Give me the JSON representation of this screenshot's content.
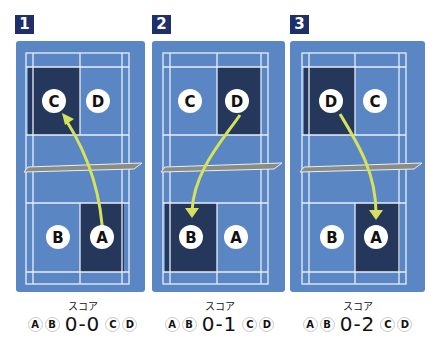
{
  "colors": {
    "panel_bg": "#5b86c4",
    "highlight": "#25385c",
    "lines": "#e8eef8",
    "net": "#8a8d80",
    "arrow": "#d6e25a",
    "badge": "#1e2f6b"
  },
  "score_label": "スコア",
  "panels": [
    {
      "number": "1",
      "top_players": [
        "C",
        "D"
      ],
      "bottom_players": [
        "B",
        "A"
      ],
      "highlight_top": "left",
      "highlight_bottom": "right",
      "shot": "A → C",
      "score": {
        "left_players": [
          "A",
          "B"
        ],
        "value": "0-0",
        "right_players": [
          "C",
          "D"
        ]
      }
    },
    {
      "number": "2",
      "top_players": [
        "C",
        "D"
      ],
      "bottom_players": [
        "B",
        "A"
      ],
      "highlight_top": "right",
      "highlight_bottom": "left",
      "shot": "D → B",
      "score": {
        "left_players": [
          "A",
          "B"
        ],
        "value": "0-1",
        "right_players": [
          "C",
          "D"
        ]
      }
    },
    {
      "number": "3",
      "top_players": [
        "D",
        "C"
      ],
      "bottom_players": [
        "B",
        "A"
      ],
      "highlight_top": "left",
      "highlight_bottom": "right",
      "shot": "D → A",
      "score": {
        "left_players": [
          "A",
          "B"
        ],
        "value": "0-2",
        "right_players": [
          "C",
          "D"
        ]
      }
    }
  ]
}
